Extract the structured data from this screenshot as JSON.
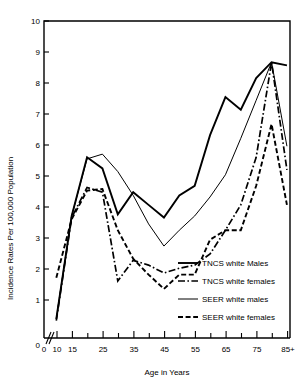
{
  "chart_data": {
    "type": "line",
    "title": "",
    "xlabel": "Age in Years",
    "ylabel": "Incidence Rates Per 100,000 Population",
    "xlim": [
      8,
      88
    ],
    "ylim": [
      0,
      10
    ],
    "grid": false,
    "legend_position": "lower-right",
    "x_tick_labels": [
      "0",
      "10",
      "15",
      "25",
      "35",
      "45",
      "55",
      "65",
      "75",
      "85+"
    ],
    "x_tick_values": [
      8,
      12,
      17,
      27,
      37,
      47,
      57,
      67,
      77,
      87
    ],
    "x_minor_ticks": [
      22,
      32,
      42,
      52,
      62,
      72,
      82
    ],
    "y_tick_labels": [
      "0",
      "1",
      "2",
      "3",
      "4",
      "5",
      "6",
      "7",
      "8",
      "9",
      "10"
    ],
    "y_tick_values": [
      0,
      1,
      2,
      3,
      4,
      5,
      6,
      7,
      8,
      9,
      10
    ],
    "axis_break": true,
    "x": [
      12,
      17,
      22,
      27,
      32,
      37,
      42,
      47,
      52,
      57,
      62,
      67,
      72,
      77,
      82,
      87
    ],
    "series": [
      {
        "name": "TNCS white Males",
        "style": "thick-solid",
        "values": [
          0.6,
          3.85,
          5.7,
          5.35,
          3.9,
          4.6,
          4.2,
          3.8,
          4.5,
          4.8,
          6.4,
          7.6,
          7.2,
          8.2,
          8.7,
          8.6
        ]
      },
      {
        "name": "TNCS white females",
        "style": "dash-dot",
        "values": [
          0.55,
          3.8,
          4.75,
          4.6,
          1.8,
          2.45,
          2.3,
          2.05,
          2.2,
          2.3,
          2.65,
          3.4,
          4.2,
          5.7,
          8.7,
          5.3
        ]
      },
      {
        "name": "SEER white males",
        "style": "thin-solid",
        "values": [
          0.6,
          3.85,
          5.65,
          5.8,
          5.25,
          4.5,
          3.6,
          2.9,
          3.4,
          3.85,
          4.45,
          5.15,
          6.3,
          7.5,
          8.7,
          6.05
        ]
      },
      {
        "name": "SEER white females",
        "style": "thick-dashed",
        "values": [
          1.9,
          3.75,
          4.65,
          4.7,
          3.4,
          2.5,
          2.0,
          1.55,
          2.0,
          2.0,
          3.1,
          3.4,
          3.4,
          4.8,
          6.75,
          4.2
        ]
      }
    ]
  },
  "legend": {
    "entries": [
      {
        "label": "TNCS white Males"
      },
      {
        "label": "TNCS white females"
      },
      {
        "label": "SEER white males"
      },
      {
        "label": "SEER white females"
      }
    ]
  }
}
